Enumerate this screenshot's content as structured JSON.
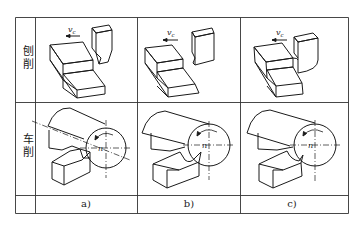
{
  "table": {
    "row_labels": [
      "刨削",
      "车削"
    ],
    "row_label_chars": {
      "planing": [
        "刨",
        "削"
      ],
      "turning": [
        "车",
        "削"
      ]
    },
    "column_labels": [
      "a)",
      "b)",
      "c)"
    ]
  },
  "annotations": {
    "cutting_speed": "v",
    "cutting_speed_sub": "c",
    "rotation": "n"
  },
  "colors": {
    "line": "#1a1a1a",
    "grid": "#333333",
    "background": "#ffffff"
  }
}
